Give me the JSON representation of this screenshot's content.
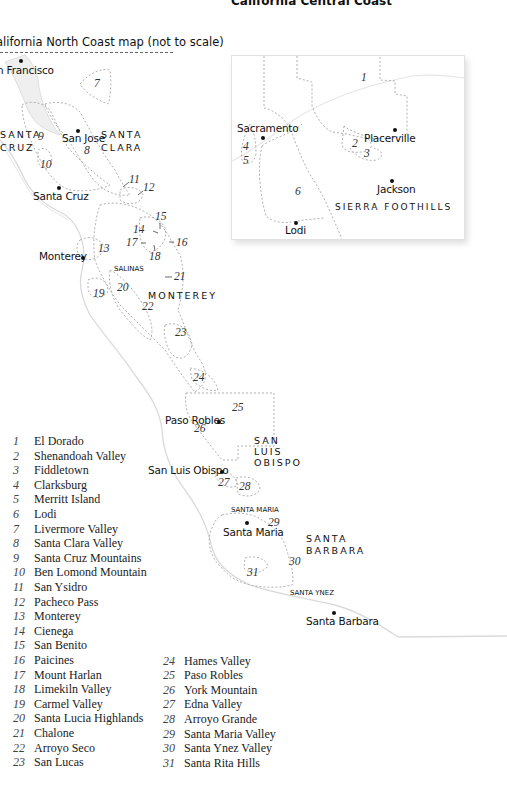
{
  "header": {
    "title": "California Central Coast"
  },
  "caption": {
    "text": "alifornia North Coast map (not to scale)"
  },
  "inset": {
    "cities": [
      {
        "name": "Placerville"
      },
      {
        "name": "Sacramento"
      },
      {
        "name": "Jackson"
      },
      {
        "name": "Lodi"
      }
    ],
    "region_label": "SIERRA FOOTHILLS",
    "numbers": [
      "1",
      "2",
      "3",
      "4",
      "5",
      "6"
    ]
  },
  "main_map": {
    "cities": {
      "san_francisco": "n Francisco",
      "san_jose": "San Jose",
      "santa_cruz": "Santa Cruz",
      "monterey": "Monterey",
      "paso_robles": "Paso Robles",
      "san_luis_obispo": "San Luis Obispo",
      "santa_maria": "Santa Maria",
      "santa_barbara": "Santa Barbara"
    },
    "counties": {
      "santa_cruz_1": "SANTA",
      "santa_cruz_2": "CRUZ",
      "santa_clara_1": "SANTA",
      "santa_clara_2": "CLARA",
      "monterey": "MONTEREY",
      "slo_1": "SAN",
      "slo_2": "LUIS",
      "slo_3": "OBISPO",
      "sb_1": "SANTA",
      "sb_2": "BARBARA"
    },
    "small_regions": {
      "salinas": "SALINAS",
      "santa_maria": "SANTA MARIA",
      "santa_ynez": "SANTA YNEZ"
    },
    "numbers": {
      "n7": "7",
      "n8": "8",
      "n9": "9",
      "n10": "10",
      "n11": "11",
      "n12": "12",
      "n13": "13",
      "n14": "14",
      "n15": "15",
      "n16": "16",
      "n17": "17",
      "n18": "18",
      "n19": "19",
      "n20": "20",
      "n21": "21",
      "n22": "22",
      "n23": "23",
      "n24": "24",
      "n25": "25",
      "n26": "26",
      "n27": "27",
      "n28": "28",
      "n29": "29",
      "n30": "30",
      "n31": "31"
    }
  },
  "legend": {
    "column1": [
      {
        "num": "1",
        "name": "El Dorado"
      },
      {
        "num": "2",
        "name": "Shenandoah Valley"
      },
      {
        "num": "3",
        "name": "Fiddletown"
      },
      {
        "num": "4",
        "name": "Clarksburg"
      },
      {
        "num": "5",
        "name": "Merritt Island"
      },
      {
        "num": "6",
        "name": "Lodi"
      },
      {
        "num": "7",
        "name": "Livermore Valley"
      },
      {
        "num": "8",
        "name": "Santa Clara Valley"
      },
      {
        "num": "9",
        "name": "Santa Cruz Mountains"
      },
      {
        "num": "10",
        "name": "Ben Lomond Mountain"
      },
      {
        "num": "11",
        "name": "San Ysidro"
      },
      {
        "num": "12",
        "name": "Pacheco Pass"
      },
      {
        "num": "13",
        "name": "Monterey"
      },
      {
        "num": "14",
        "name": "Cienega"
      },
      {
        "num": "15",
        "name": "San Benito"
      },
      {
        "num": "16",
        "name": "Paicines"
      },
      {
        "num": "17",
        "name": "Mount Harlan"
      },
      {
        "num": "18",
        "name": "Limekiln Valley"
      },
      {
        "num": "19",
        "name": "Carmel Valley"
      },
      {
        "num": "20",
        "name": "Santa Lucia Highlands"
      },
      {
        "num": "21",
        "name": "Chalone"
      },
      {
        "num": "22",
        "name": "Arroyo Seco"
      },
      {
        "num": "23",
        "name": "San Lucas"
      }
    ],
    "column2": [
      {
        "num": "24",
        "name": "Hames Valley"
      },
      {
        "num": "25",
        "name": "Paso Robles"
      },
      {
        "num": "26",
        "name": "York Mountain"
      },
      {
        "num": "27",
        "name": "Edna Valley"
      },
      {
        "num": "28",
        "name": "Arroyo Grande"
      },
      {
        "num": "29",
        "name": "Santa Maria Valley"
      },
      {
        "num": "30",
        "name": "Santa Ynez Valley"
      },
      {
        "num": "31",
        "name": "Santa Rita Hills"
      }
    ]
  },
  "colors": {
    "boundary": "#a8a8a8",
    "coast": "#dcdcdc",
    "text": "#111111"
  }
}
